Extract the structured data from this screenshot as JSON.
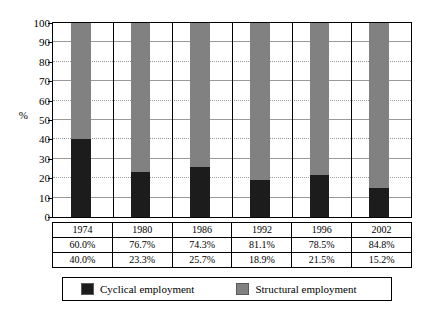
{
  "chart_data": {
    "type": "bar",
    "subtype": "stacked-100",
    "title": "",
    "xlabel": "",
    "ylabel": "%",
    "ylim": [
      0,
      100
    ],
    "yticks": [
      0,
      10,
      20,
      30,
      40,
      50,
      60,
      70,
      80,
      90,
      100
    ],
    "ytick_labels": [
      "0",
      "10",
      "20",
      "30",
      "40",
      "50",
      "60",
      "70",
      "80",
      "90",
      "100"
    ],
    "grid": true,
    "legend_position": "bottom",
    "categories": [
      "1974",
      "1980",
      "1986",
      "1992",
      "1996",
      "2002"
    ],
    "series": [
      {
        "name": "Cyclical employment",
        "color": "#1c1c1c",
        "values": [
          40.0,
          23.3,
          25.7,
          18.9,
          21.5,
          15.2
        ],
        "labels": [
          "40.0%",
          "23.3%",
          "25.7%",
          "18.9%",
          "21.5%",
          "15.2%"
        ]
      },
      {
        "name": "Structural employment",
        "color": "#818181",
        "values": [
          60.0,
          76.7,
          74.3,
          81.1,
          78.5,
          84.8
        ],
        "labels": [
          "60.0%",
          "76.7%",
          "74.3%",
          "81.1%",
          "78.5%",
          "84.8%"
        ]
      }
    ]
  },
  "axis": {
    "y_title": "%",
    "tick_labels": [
      "100",
      "90",
      "80",
      "70",
      "60",
      "50",
      "40",
      "30",
      "20",
      "10",
      "0"
    ]
  },
  "table": {
    "rows": [
      {
        "name": "year-row",
        "cells": [
          "1974",
          "1980",
          "1986",
          "1992",
          "1996",
          "2002"
        ]
      },
      {
        "name": "structural-row",
        "cells": [
          "60.0%",
          "76.7%",
          "74.3%",
          "81.1%",
          "78.5%",
          "84.8%"
        ]
      },
      {
        "name": "cyclical-row",
        "cells": [
          "40.0%",
          "23.3%",
          "25.7%",
          "18.9%",
          "21.5%",
          "15.2%"
        ]
      }
    ]
  },
  "legend": {
    "entries": [
      {
        "label": "Cyclical employment",
        "color": "#1c1c1c"
      },
      {
        "label": "Structural employment",
        "color": "#818181"
      }
    ]
  }
}
